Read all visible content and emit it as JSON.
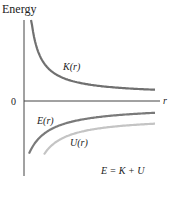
{
  "chart_data": {
    "type": "line",
    "title": "",
    "ylabel": "Energy",
    "xlabel": "r",
    "origin_label": "0",
    "equation": "E = K + U",
    "grid": false,
    "xlim": [
      0,
      10
    ],
    "ylim": [
      -5,
      5
    ],
    "series": [
      {
        "name": "K(r)",
        "label": "K(r)",
        "color": "#707070",
        "relation": "K = k/r",
        "k": 1.0,
        "sign": 1
      },
      {
        "name": "E(r)",
        "label": "E(r)",
        "color": "#7a7a7a",
        "relation": "E = -k/(2r)",
        "k": 1.0,
        "sign": -1
      },
      {
        "name": "U(r)",
        "label": "U(r)",
        "color": "#c4c4c4",
        "relation": "U = -2k/r",
        "k": 2.0,
        "sign": -1
      }
    ],
    "colors": {
      "axis": "#444444",
      "text": "#222222"
    }
  }
}
